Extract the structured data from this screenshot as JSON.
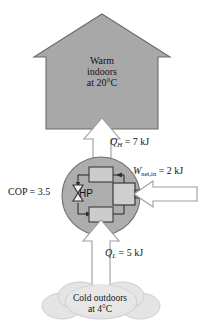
{
  "figure": {
    "house": {
      "line1": "Warm",
      "line2": "indoors",
      "line3": "at 20°C",
      "fill_color": "#a8a8a8",
      "stroke_color": "#6e6e6e"
    },
    "cloud": {
      "line1": "Cold outdoors",
      "line2": "at 4°C",
      "fill_color": "#e2e2e2",
      "stroke_color": "#c9c9c9"
    },
    "unit": {
      "label": "HP",
      "fill_color": "#b5b5b5",
      "stroke_color": "#5a5a5a"
    },
    "cop": {
      "symbol": "COP",
      "equals": "=",
      "value": "3.5",
      "full": "COP = 3.5"
    },
    "heat_out": {
      "symbol": "Q",
      "subscript": "H",
      "equals": "=",
      "value": "7",
      "unit": "kJ",
      "full": "Q_H = 7 kJ",
      "direction": "up"
    },
    "heat_in": {
      "symbol": "Q",
      "subscript": "L",
      "equals": "=",
      "value": "5",
      "unit": "kJ",
      "full": "Q_L = 5 kJ",
      "direction": "up"
    },
    "work_in": {
      "symbol": "W",
      "subscript": "net,in",
      "equals": "=",
      "value": "2",
      "unit": "kJ",
      "full": "W_net,in = 2 kJ",
      "direction": "left"
    },
    "arrow_style": {
      "fill_color": "#ffffff",
      "stroke_color": "#9a9a9a"
    },
    "components": [
      {
        "name": "condenser",
        "position": "top"
      },
      {
        "name": "evaporator",
        "position": "bottom"
      },
      {
        "name": "expansion-valve",
        "position": "left"
      },
      {
        "name": "compressor",
        "position": "right"
      }
    ]
  }
}
